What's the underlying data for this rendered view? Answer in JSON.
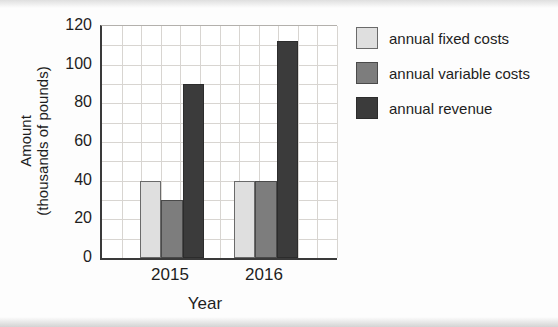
{
  "chart_data": {
    "type": "bar",
    "title": "",
    "categories": [
      "2015",
      "2016"
    ],
    "series": [
      {
        "name": "annual fixed costs",
        "color": "#dfdfdf",
        "border": "#6a6a6a",
        "values": [
          40,
          40
        ]
      },
      {
        "name": "annual variable costs",
        "color": "#7d7d7d",
        "border": "#4a4a4a",
        "values": [
          30,
          40
        ]
      },
      {
        "name": "annual revenue",
        "color": "#3b3b3b",
        "border": "#2c2c2c",
        "values": [
          90,
          112
        ]
      }
    ],
    "xlabel": "Year",
    "ylabel_line1": "Amount",
    "ylabel_line2": "(thousands of pounds)",
    "ylim": [
      0,
      120
    ],
    "yticks": [
      0,
      20,
      40,
      60,
      80,
      100,
      120
    ],
    "minor_grid_step": 10,
    "grid": "on",
    "legend_position": "right",
    "colors": {
      "axis_line": "#3a3a3a",
      "grid_line": "#d8d5d1",
      "text": "#1e1e1e",
      "plot_background": "#ffffff"
    }
  }
}
